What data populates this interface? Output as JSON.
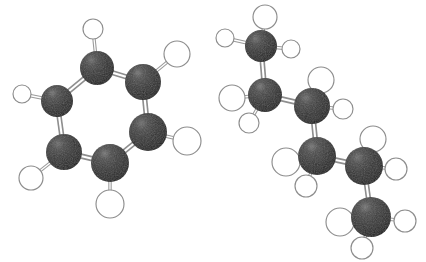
{
  "figure": {
    "background_color": "#ffffff",
    "width": 426,
    "height": 262,
    "style": "ball-and-stick",
    "render": "grayscale raster, shaded spheres"
  },
  "palette": {
    "carbon_fill": "#2f2f2f",
    "carbon_highlight": "#6f6f6f",
    "carbon_shadow": "#111111",
    "hydrogen_fill": "#ffffff",
    "hydrogen_stroke": "#8d8d8d",
    "bond_stroke": "#8e8e8e",
    "bond_core": "#ffffff",
    "background": "#ffffff"
  },
  "molecules": [
    {
      "id": "benzene",
      "name": "Benzene",
      "formula": "C6H6",
      "position": "left",
      "carbon_radius": 17,
      "hydrogen_radius": 11,
      "carbons": [
        {
          "label": "C1",
          "x": 97,
          "y": 68,
          "r": 17
        },
        {
          "label": "C2",
          "x": 143,
          "y": 82,
          "r": 18
        },
        {
          "label": "C3",
          "x": 148,
          "y": 132,
          "r": 19
        },
        {
          "label": "C4",
          "x": 110,
          "y": 163,
          "r": 19
        },
        {
          "label": "C5",
          "x": 64,
          "y": 152,
          "r": 18
        },
        {
          "label": "C6",
          "x": 57,
          "y": 101,
          "r": 16
        }
      ],
      "hydrogens": [
        {
          "label": "H1",
          "x": 93,
          "y": 29,
          "r": 10,
          "bonded_to": "C1"
        },
        {
          "label": "H2",
          "x": 177,
          "y": 54,
          "r": 13,
          "bonded_to": "C2"
        },
        {
          "label": "H3",
          "x": 187,
          "y": 141,
          "r": 14,
          "bonded_to": "C3"
        },
        {
          "label": "H4",
          "x": 110,
          "y": 204,
          "r": 14,
          "bonded_to": "C4"
        },
        {
          "label": "H5",
          "x": 31,
          "y": 178,
          "r": 12,
          "bonded_to": "C5"
        },
        {
          "label": "H6",
          "x": 22,
          "y": 94,
          "r": 9,
          "bonded_to": "C6"
        }
      ],
      "ring_bonds": [
        [
          "C1",
          "C2"
        ],
        [
          "C2",
          "C3"
        ],
        [
          "C3",
          "C4"
        ],
        [
          "C4",
          "C5"
        ],
        [
          "C5",
          "C6"
        ],
        [
          "C6",
          "C1"
        ]
      ]
    },
    {
      "id": "hexane",
      "name": "Hexane",
      "formula": "C6H14",
      "position": "right",
      "conformation": "zigzag anti chain",
      "carbons": [
        {
          "label": "C1",
          "x": 261,
          "y": 46,
          "r": 16
        },
        {
          "label": "C2",
          "x": 265,
          "y": 95,
          "r": 17
        },
        {
          "label": "C3",
          "x": 312,
          "y": 106,
          "r": 18
        },
        {
          "label": "C4",
          "x": 317,
          "y": 156,
          "r": 19
        },
        {
          "label": "C5",
          "x": 364,
          "y": 166,
          "r": 19
        },
        {
          "label": "C6",
          "x": 371,
          "y": 217,
          "r": 20
        }
      ],
      "hydrogens": [
        {
          "label": "H1a",
          "x": 265,
          "y": 17,
          "r": 12,
          "bonded_to": "C1"
        },
        {
          "label": "H1b",
          "x": 225,
          "y": 38,
          "r": 9,
          "bonded_to": "C1"
        },
        {
          "label": "H1c",
          "x": 291,
          "y": 49,
          "r": 9,
          "bonded_to": "C1"
        },
        {
          "label": "H2a",
          "x": 232,
          "y": 98,
          "r": 13,
          "bonded_to": "C2"
        },
        {
          "label": "H2b",
          "x": 249,
          "y": 123,
          "r": 10,
          "bonded_to": "C2"
        },
        {
          "label": "H3a",
          "x": 321,
          "y": 80,
          "r": 13,
          "bonded_to": "C3"
        },
        {
          "label": "H3b",
          "x": 343,
          "y": 109,
          "r": 10,
          "bonded_to": "C3"
        },
        {
          "label": "H4a",
          "x": 286,
          "y": 162,
          "r": 14,
          "bonded_to": "C4"
        },
        {
          "label": "H4b",
          "x": 306,
          "y": 186,
          "r": 11,
          "bonded_to": "C4"
        },
        {
          "label": "H5a",
          "x": 373,
          "y": 139,
          "r": 13,
          "bonded_to": "C5"
        },
        {
          "label": "H5b",
          "x": 396,
          "y": 169,
          "r": 11,
          "bonded_to": "C5"
        },
        {
          "label": "H6a",
          "x": 340,
          "y": 222,
          "r": 14,
          "bonded_to": "C6"
        },
        {
          "label": "H6b",
          "x": 405,
          "y": 221,
          "r": 11,
          "bonded_to": "C6"
        },
        {
          "label": "H6c",
          "x": 362,
          "y": 248,
          "r": 11,
          "bonded_to": "C6"
        }
      ],
      "chain_bonds": [
        [
          "C1",
          "C2"
        ],
        [
          "C2",
          "C3"
        ],
        [
          "C3",
          "C4"
        ],
        [
          "C4",
          "C5"
        ],
        [
          "C5",
          "C6"
        ]
      ]
    }
  ]
}
